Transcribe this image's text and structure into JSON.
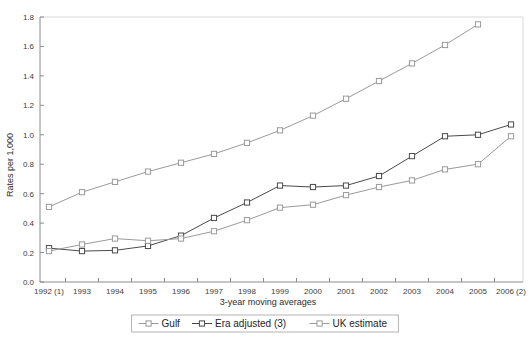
{
  "chart_data": {
    "type": "line",
    "title": "",
    "xlabel": "3-year moving averages",
    "ylabel": "Rates per 1,000",
    "ylim": [
      0.0,
      1.8
    ],
    "ytick_step": 0.2,
    "grid": false,
    "legend_position": "bottom-center",
    "categories": [
      "1992 (1)",
      "1993",
      "1994",
      "1995",
      "1996",
      "1997",
      "1998",
      "1999",
      "2000",
      "2001",
      "2002",
      "2003",
      "2004",
      "2005",
      "2006 (2)"
    ],
    "ytick_labels": [
      "0.0",
      "0.2",
      "0.4",
      "0.6",
      "0.8",
      "1.0",
      "1.2",
      "1.4",
      "1.6",
      "1.8"
    ],
    "ytick_values": [
      0.0,
      0.2,
      0.4,
      0.6,
      0.8,
      1.0,
      1.2,
      1.4,
      1.6,
      1.8
    ],
    "series": [
      {
        "name": "Gulf",
        "color": "#9a9a9a",
        "marker": "open-square",
        "values": [
          0.51,
          0.61,
          0.68,
          0.75,
          0.81,
          0.87,
          0.945,
          1.03,
          1.13,
          1.245,
          1.365,
          1.485,
          1.61,
          1.75,
          null
        ]
      },
      {
        "name": "Era adjusted (3)",
        "color": "#4a4a4a",
        "marker": "open-square",
        "values": [
          0.23,
          0.21,
          0.215,
          0.245,
          0.315,
          0.435,
          0.54,
          0.655,
          0.645,
          0.655,
          0.72,
          0.855,
          0.99,
          1.0,
          1.07
        ]
      },
      {
        "name": "UK estimate",
        "color": "#9a9a9a",
        "marker": "open-square",
        "values": [
          0.21,
          0.255,
          0.295,
          0.28,
          0.295,
          0.345,
          0.42,
          0.505,
          0.525,
          0.59,
          0.645,
          0.69,
          0.765,
          0.8,
          0.99
        ]
      }
    ]
  },
  "axes": {
    "y_title": "Rates per 1,000",
    "x_title": "3-year moving averages"
  },
  "legend": {
    "items": [
      {
        "label": "Gulf"
      },
      {
        "label": "Era adjusted (3)"
      },
      {
        "label": "UK estimate"
      }
    ]
  },
  "colors": {
    "gulf": "#9a9a9a",
    "era_adjusted": "#4a4a4a",
    "uk_estimate": "#9a9a9a",
    "axis": "#8c8c8c",
    "frame": "#d8d8d8",
    "text": "#2e2e2e",
    "background": "#ffffff"
  }
}
